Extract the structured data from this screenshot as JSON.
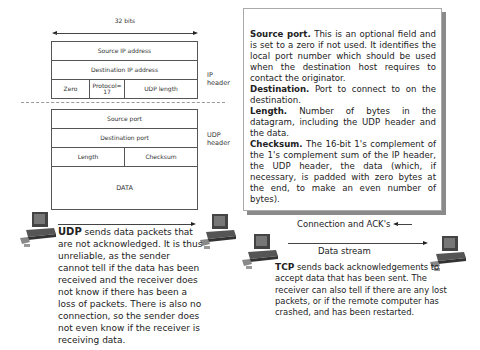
{
  "diagram": {
    "width_label": "32 bits",
    "ip_header": {
      "label": "IP header",
      "rows": [
        {
          "cells": [
            "Source IP address"
          ]
        },
        {
          "cells": [
            "Destination IP address"
          ]
        },
        {
          "cells": [
            "Zero",
            "Protocol= 17",
            "UDP length"
          ]
        }
      ]
    },
    "udp_header": {
      "label": "UDP header",
      "rows": [
        {
          "cells": [
            "Source port"
          ]
        },
        {
          "cells": [
            "Destination port"
          ]
        },
        {
          "cells": [
            "Length",
            "Checksum"
          ]
        }
      ],
      "data_label": "DATA"
    }
  },
  "info_box": {
    "items": [
      {
        "term": "Source port.",
        "text": " This is an optional field and is set to a zero if not used. It identifies the local port number which should be used when the destination host requires to contact the originator."
      },
      {
        "term": "Destination.",
        "text": " Port to connect to on the destination."
      },
      {
        "term": "Length.",
        "text": " Number of bytes in the datagram, including the UDP header and the data."
      },
      {
        "term": "Checksum.",
        "text": " The 16-bit 1's complement of the 1's complement sum of the IP header, the UDP header, the data (which, if necessary, is padded with zero bytes at the end, to make an even number of bytes)."
      }
    ]
  },
  "udp_section": {
    "title": "UDP",
    "text": " sends data packets that are not acknowledged. It is thus unreliable, as the sender cannot tell if the data has been received and the receiver does not know if there has been a loss of packets. There is also no connection, so the sender does not even know if the receiver is receiving data."
  },
  "tcp_section": {
    "connection_label": "Connection and ACK's",
    "stream_label": "Data stream",
    "title": "TCP",
    "text": " sends back acknowledgements to accept data that has been sent. The receiver can also tell if there are any lost packets, or if the remote computer has crashed, and has been restarted."
  },
  "icons": {
    "computer": "desktop-computer-icon"
  }
}
